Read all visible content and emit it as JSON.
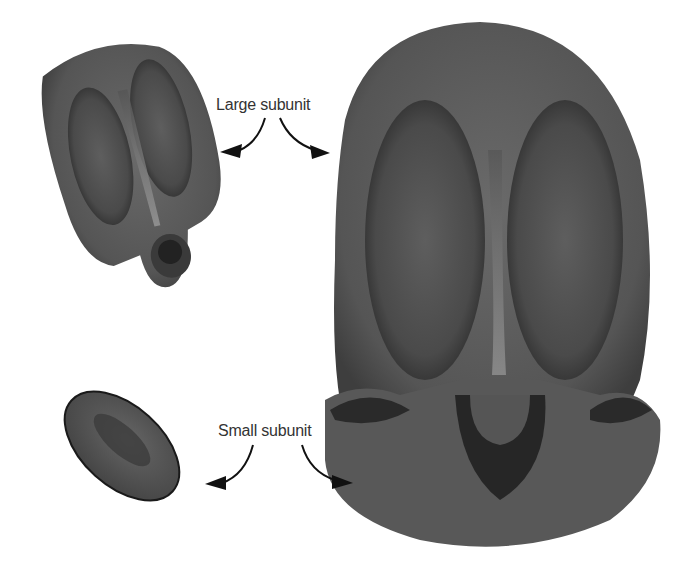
{
  "diagram": {
    "labels": {
      "large": "Large subunit",
      "small": "Small subunit"
    },
    "parts": [
      {
        "id": "large-subunit-small-view",
        "description": "Large ribosomal subunit (separate, tilted)"
      },
      {
        "id": "small-subunit-small-view",
        "description": "Small ribosomal subunit (separate, oval)"
      },
      {
        "id": "assembled-ribosome",
        "description": "Assembled ribosome with large subunit on top of small subunit"
      }
    ],
    "colors": {
      "body": "#5a5a5a",
      "dark": "#2a2a2a",
      "highlight": "#9a9a9a",
      "background": "#ffffff",
      "text": "#333333"
    }
  }
}
